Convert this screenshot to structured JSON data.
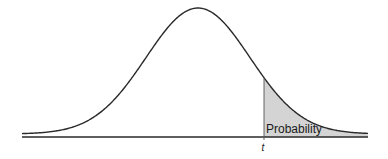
{
  "chart_data": {
    "type": "area",
    "title": "",
    "xlabel": "",
    "ylabel": "",
    "grid": false,
    "legend": null,
    "curve": {
      "shape": "bell",
      "center_px": 198,
      "peak_y_px": 8,
      "left_px": 22,
      "right_px": 368,
      "sigma_px": 52,
      "baseline_y_px": 137
    },
    "shaded_region": {
      "from": "t",
      "to": "+infinity",
      "start_px": 264,
      "fill": "#d4d4d4",
      "label": "Probability"
    },
    "annotations": [
      {
        "text": "Probability",
        "x_px": 266,
        "y_px": 133
      },
      {
        "text": "t",
        "x_px": 262,
        "y_px": 151
      }
    ]
  },
  "labels": {
    "probability": "Probability",
    "t": "t"
  },
  "colors": {
    "line": "#2a2a2a",
    "shade": "#d4d4d4",
    "background": "#ffffff"
  }
}
